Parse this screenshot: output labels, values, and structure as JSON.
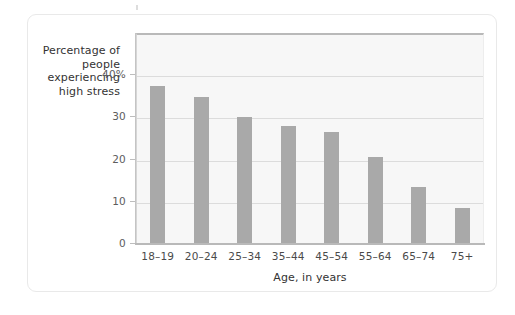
{
  "chart_data": {
    "type": "bar",
    "title": "",
    "subtitle": "",
    "xlabel": "Age, in years",
    "ylabel": "Percentage of people experiencing high stress",
    "ylabel_lines": [
      "Percentage of",
      "people",
      "experiencing",
      "high stress"
    ],
    "categories": [
      "18–19",
      "20–24",
      "25–34",
      "35–44",
      "45–54",
      "55–64",
      "65–74",
      "75+"
    ],
    "values": [
      37.2,
      34.6,
      29.8,
      27.7,
      26.3,
      20.4,
      13.3,
      8.3
    ],
    "series": [
      {
        "name": "Percentage of people experiencing high stress",
        "values": [
          37.2,
          34.6,
          29.8,
          27.7,
          26.3,
          20.4,
          13.3,
          8.3
        ]
      }
    ],
    "ytick_labels": [
      "0",
      "10",
      "20",
      "30",
      "40%"
    ],
    "ytick_values": [
      0,
      10,
      20,
      30,
      40
    ],
    "ylim": [
      0,
      49.8
    ],
    "xlim_note": "categorical",
    "grid": "horizontal",
    "legend": "none",
    "legend_position": "none",
    "colors": {
      "bar": "#a9a9a9",
      "plot_background": "#f7f7f7",
      "gridline": "#dcdcdc",
      "axis": "#b9b9b9",
      "text": "#333333",
      "tick_text": "#5d5d5d",
      "card_border": "#e9e9e9",
      "page_background": "#ffffff"
    }
  },
  "figure": {
    "axis_y_title_lines": [
      "Percentage of",
      "people",
      "experiencing",
      "high stress"
    ],
    "axis_x_title": "Age, in years"
  }
}
